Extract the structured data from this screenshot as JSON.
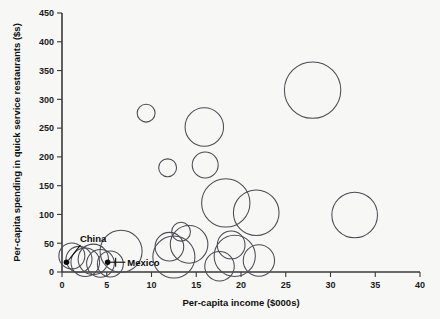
{
  "chart_data": {
    "type": "scatter",
    "title": "",
    "xlabel": "Per-capita income ($000s)",
    "ylabel": "Per-capita spending in quick service restaurants ($s)",
    "xlim": [
      0,
      40
    ],
    "ylim": [
      0,
      450
    ],
    "xticks": [
      0,
      5,
      10,
      15,
      20,
      25,
      30,
      35,
      40
    ],
    "yticks": [
      0,
      50,
      100,
      150,
      200,
      250,
      300,
      350,
      400,
      450
    ],
    "xtick_labels": [
      "0",
      "5",
      "10",
      "15",
      "20",
      "25",
      "30",
      "35",
      "40"
    ],
    "ytick_labels": [
      "0",
      "50",
      "100",
      "150",
      "200",
      "250",
      "300",
      "350",
      "400",
      "450"
    ],
    "grid": false,
    "legend": "none",
    "marker": "open-circle",
    "size_units": "bubble radius in income-axis units (area encodes population)",
    "points": [
      {
        "x": 1.1,
        "y": 28,
        "r": 1.45
      },
      {
        "x": 1.9,
        "y": 22,
        "r": 1.45
      },
      {
        "x": 2.6,
        "y": 17,
        "r": 1.6
      },
      {
        "x": 3.5,
        "y": 22,
        "r": 1.7
      },
      {
        "x": 4.3,
        "y": 15,
        "r": 1.55
      },
      {
        "x": 5.4,
        "y": 14,
        "r": 1.45
      },
      {
        "x": 6.6,
        "y": 36,
        "r": 2.35
      },
      {
        "x": 9.4,
        "y": 276,
        "r": 1.0
      },
      {
        "x": 11.8,
        "y": 181,
        "r": 1.0
      },
      {
        "x": 12.0,
        "y": 44,
        "r": 1.6
      },
      {
        "x": 12.5,
        "y": 26,
        "r": 2.35
      },
      {
        "x": 13.3,
        "y": 70,
        "r": 1.05
      },
      {
        "x": 14.2,
        "y": 48,
        "r": 2.1
      },
      {
        "x": 15.9,
        "y": 252,
        "r": 2.15
      },
      {
        "x": 16.0,
        "y": 186,
        "r": 1.45
      },
      {
        "x": 17.6,
        "y": 10,
        "r": 1.65
      },
      {
        "x": 18.3,
        "y": 120,
        "r": 2.7
      },
      {
        "x": 18.9,
        "y": 47,
        "r": 1.55
      },
      {
        "x": 19.3,
        "y": 28,
        "r": 2.3
      },
      {
        "x": 21.7,
        "y": 103,
        "r": 2.55
      },
      {
        "x": 22.0,
        "y": 20,
        "r": 1.75
      },
      {
        "x": 28.0,
        "y": 316,
        "r": 3.15
      },
      {
        "x": 32.7,
        "y": 99,
        "r": 2.55
      }
    ],
    "annotations": [
      {
        "label": "China",
        "x": 0.5,
        "y": 17,
        "label_x": 2.0,
        "label_y": 52,
        "anchor": "start"
      },
      {
        "label": "Mexico",
        "x": 5.1,
        "y": 17,
        "label_x": 7.3,
        "label_y": 17,
        "anchor": "start"
      }
    ]
  }
}
